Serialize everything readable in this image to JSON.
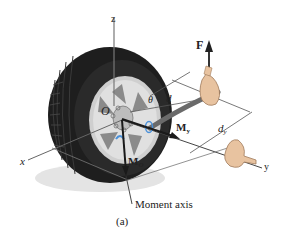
{
  "figure": {
    "caption": "(a)",
    "labels": {
      "z_axis": "z",
      "x_axis": "x",
      "y_axis": "y",
      "origin": "O",
      "force": "F",
      "theta": "θ",
      "distance_d": "d",
      "distance_dy_main": "d",
      "distance_dy_sub": "y",
      "moment_y_main": "M",
      "moment_y_sub": "y",
      "moment_o_main": "M",
      "moment_o_sub": "O",
      "moment_axis": "Moment axis"
    },
    "colors": {
      "tire": "#1e1e1e",
      "rim": "#c9c9c9",
      "rim_dark": "#8e8e8e",
      "axis_line": "#555555",
      "wrench": "#6a6a6a",
      "arrow": "#1a1a1a",
      "rotation_accent": "#4a90d9",
      "hand": "#e8c3a0",
      "shadow": "#e2e2e2"
    }
  }
}
